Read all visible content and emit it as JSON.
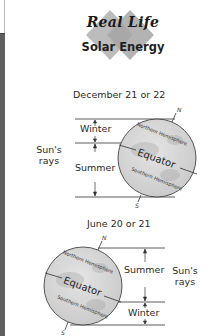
{
  "logo": {
    "line1": "Real Life",
    "line2": "Solar Energy"
  },
  "december": {
    "title": "December 21 or 22",
    "upper_label": "Winter",
    "lower_label": "Summer",
    "rays_label_line1": "Sun's",
    "rays_label_line2": "rays",
    "north_label": "N",
    "south_label": "S",
    "northern_hemisphere": "Northern Hemisphere",
    "equator": "Equator",
    "southern_hemisphere": "Southern Hemisphere"
  },
  "june": {
    "title": "June 20 or 21",
    "upper_label": "Summer",
    "lower_label": "Winter",
    "rays_label_line1": "Sun's",
    "rays_label_line2": "rays",
    "north_label": "N",
    "south_label": "S",
    "northern_hemisphere": "Northern Hemisphere",
    "equator": "Equator",
    "southern_hemisphere": "Southern Hemisphere"
  },
  "colors": {
    "edge_bar": "#5f5f5f",
    "globe_fill": "#d6d6d6",
    "logo_diamond": "#b9b9b9",
    "lines": "#333333"
  }
}
